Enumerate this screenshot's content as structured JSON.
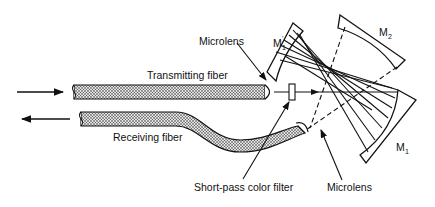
{
  "diagram": {
    "type": "optical-schematic",
    "labels": {
      "transmitting_fiber": "Transmitting fiber",
      "receiving_fiber": "Receiving fiber",
      "microlens_top": "Microlens",
      "microlens_bottom": "Microlens",
      "filter": "Short-pass color filter",
      "mirror_m1_prime": "M",
      "mirror_m1_prime_sub": "1",
      "mirror_m1_prime_sup": "'",
      "mirror_m2": "M",
      "mirror_m2_sub": "2",
      "mirror_m1": "M",
      "mirror_m1_sub": "1"
    },
    "arrows": {
      "input_direction": "right",
      "output_direction": "left"
    },
    "colors": {
      "ink": "#111111",
      "background": "#ffffff",
      "fiber_fill": "#bdbdbd"
    }
  }
}
